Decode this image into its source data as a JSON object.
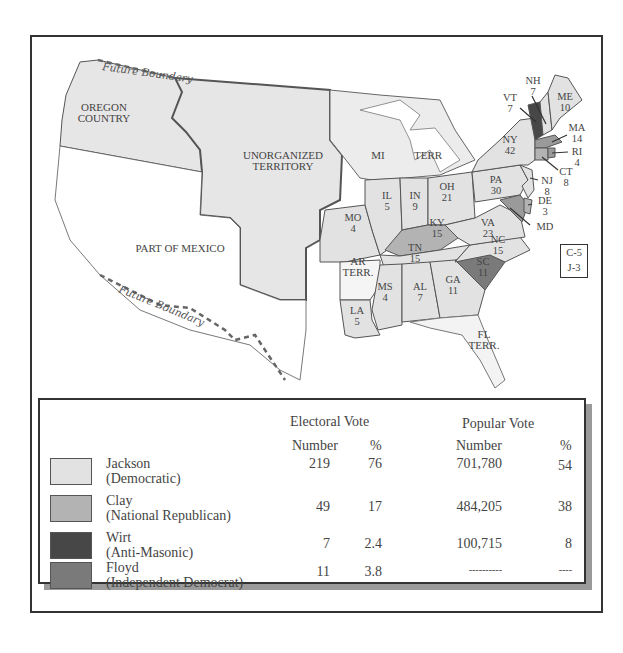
{
  "map": {
    "regions": {
      "oregon": "OREGON\nCOUNTRY",
      "oregon_l1": "OREGON",
      "oregon_l2": "COUNTRY",
      "unorg_l1": "UNORGANIZED",
      "unorg_l2": "TERRITORY",
      "mexico": "PART OF MEXICO",
      "mi_terr_a": "MI",
      "mi_terr_b": "TERR",
      "ar_l1": "AR",
      "ar_l2": "TERR.",
      "fl_l1": "FL",
      "fl_l2": "TERR."
    },
    "future_boundary_label": "Future Boundary",
    "states": [
      {
        "abbr": "ME",
        "votes": "10",
        "winner": "Jackson"
      },
      {
        "abbr": "NH",
        "votes": "7",
        "winner": "Jackson"
      },
      {
        "abbr": "VT",
        "votes": "7",
        "winner": "Wirt"
      },
      {
        "abbr": "MA",
        "votes": "14",
        "winner": "Clay"
      },
      {
        "abbr": "RI",
        "votes": "4",
        "winner": "Clay"
      },
      {
        "abbr": "CT",
        "votes": "8",
        "winner": "Clay"
      },
      {
        "abbr": "NY",
        "votes": "42",
        "winner": "Jackson"
      },
      {
        "abbr": "NJ",
        "votes": "8",
        "winner": "Jackson"
      },
      {
        "abbr": "PA",
        "votes": "30",
        "winner": "Jackson"
      },
      {
        "abbr": "DE",
        "votes": "3",
        "winner": "Clay"
      },
      {
        "abbr": "MD",
        "votes": "C-5 J-3",
        "winner": "Split"
      },
      {
        "abbr": "VA",
        "votes": "23",
        "winner": "Jackson"
      },
      {
        "abbr": "NC",
        "votes": "15",
        "winner": "Jackson"
      },
      {
        "abbr": "SC",
        "votes": "11",
        "winner": "Floyd"
      },
      {
        "abbr": "GA",
        "votes": "11",
        "winner": "Jackson"
      },
      {
        "abbr": "AL",
        "votes": "7",
        "winner": "Jackson"
      },
      {
        "abbr": "MS",
        "votes": "4",
        "winner": "Jackson"
      },
      {
        "abbr": "LA",
        "votes": "5",
        "winner": "Jackson"
      },
      {
        "abbr": "TN",
        "votes": "15",
        "winner": "Jackson"
      },
      {
        "abbr": "KY",
        "votes": "15",
        "winner": "Clay"
      },
      {
        "abbr": "OH",
        "votes": "21",
        "winner": "Jackson"
      },
      {
        "abbr": "IN",
        "votes": "9",
        "winner": "Jackson"
      },
      {
        "abbr": "IL",
        "votes": "5",
        "winner": "Jackson"
      },
      {
        "abbr": "MO",
        "votes": "4",
        "winner": "Jackson"
      }
    ],
    "md_split": {
      "line1": "C-5",
      "line2": "J-3"
    }
  },
  "legend": {
    "electoral_header": "Electoral Vote",
    "popular_header": "Popular Vote",
    "sub_number": "Number",
    "sub_pct": "%",
    "rows": [
      {
        "name": "Jackson",
        "party": "(Democratic)",
        "ev": "219",
        "ev_pct": "76",
        "pv": "701,780",
        "pv_pct": "54",
        "color": "#e2e2e2"
      },
      {
        "name": "Clay",
        "party": "(National Republican)",
        "ev": "49",
        "ev_pct": "17",
        "pv": "484,205",
        "pv_pct": "38",
        "color": "#b3b3b3"
      },
      {
        "name": "Wirt",
        "party": "(Anti-Masonic)",
        "ev": "7",
        "ev_pct": "2.4",
        "pv": "100,715",
        "pv_pct": "8",
        "color": "#474747"
      },
      {
        "name": "Floyd",
        "party": "(Independent Democrat)",
        "ev": "11",
        "ev_pct": "3.8",
        "pv": "----------",
        "pv_pct": "----",
        "color": "#7a7a7a"
      }
    ]
  },
  "colors": {
    "jackson": "#e2e2e2",
    "clay": "#b3b3b3",
    "wirt": "#474747",
    "floyd": "#7a7a7a",
    "outline": "#555555"
  }
}
